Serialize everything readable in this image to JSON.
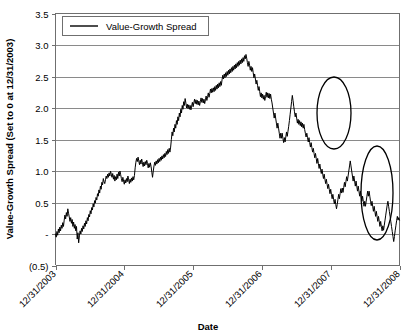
{
  "chart_data": {
    "type": "line",
    "title": "",
    "xlabel": "Date",
    "ylabel": "Value-Growth Spread (Set to 0 at 12/31/2003)",
    "legend": [
      "Value-Growth Spread"
    ],
    "legend_position": "top-left-inside",
    "grid": true,
    "ylim": [
      -0.5,
      3.5
    ],
    "yticks": [
      3.5,
      3.0,
      2.5,
      2.0,
      1.5,
      1.0,
      0.5,
      0,
      -0.5
    ],
    "ytick_labels": [
      "3.5",
      "3.0",
      "2.5",
      "2.0",
      "1.5",
      "1.0",
      "0.5",
      "-",
      "(0.5)"
    ],
    "xticks": [
      "12/31/2003",
      "12/31/2004",
      "12/31/2005",
      "12/31/2006",
      "12/31/2007",
      "12/31/2008"
    ],
    "xlim": [
      "12/31/2003",
      "12/31/2008"
    ],
    "series": [
      {
        "name": "Value-Growth Spread",
        "color": "#000000",
        "values": [
          0.0,
          -0.05,
          0.04,
          -0.02,
          0.08,
          0.02,
          0.11,
          0.05,
          0.14,
          0.09,
          0.18,
          0.12,
          0.22,
          0.3,
          0.24,
          0.34,
          0.28,
          0.4,
          0.33,
          0.27,
          0.2,
          0.26,
          0.17,
          0.23,
          0.12,
          0.19,
          0.09,
          0.15,
          0.05,
          0.12,
          -0.08,
          0.02,
          -0.14,
          -0.03,
          0.05,
          0.0,
          0.09,
          0.04,
          0.13,
          0.08,
          0.17,
          0.12,
          0.21,
          0.16,
          0.26,
          0.21,
          0.31,
          0.27,
          0.37,
          0.32,
          0.42,
          0.38,
          0.48,
          0.43,
          0.53,
          0.49,
          0.58,
          0.54,
          0.64,
          0.6,
          0.7,
          0.65,
          0.76,
          0.71,
          0.82,
          0.78,
          0.88,
          0.83,
          0.8,
          0.86,
          0.92,
          0.88,
          0.95,
          0.9,
          0.97,
          0.92,
          1.0,
          0.95,
          0.9,
          0.96,
          0.87,
          0.93,
          0.84,
          0.91,
          0.86,
          0.95,
          0.88,
          0.98,
          0.92,
          1.0,
          0.94,
          0.88,
          0.83,
          0.9,
          0.84,
          0.79,
          0.86,
          0.81,
          0.88,
          0.83,
          0.92,
          0.86,
          0.8,
          0.87,
          0.82,
          0.89,
          0.84,
          0.91,
          0.86,
          0.93,
          1.05,
          1.14,
          1.2,
          1.15,
          1.22,
          1.16,
          1.1,
          1.17,
          1.11,
          1.19,
          1.13,
          1.07,
          1.14,
          1.08,
          1.15,
          1.1,
          1.17,
          1.12,
          1.05,
          1.12,
          1.06,
          1.13,
          1.07,
          0.98,
          0.9,
          1.0,
          1.08,
          1.14,
          1.09,
          1.16,
          1.11,
          1.18,
          1.13,
          1.2,
          1.15,
          1.22,
          1.17,
          1.24,
          1.19,
          1.26,
          1.21,
          1.28,
          1.23,
          1.31,
          1.26,
          1.34,
          1.28,
          1.36,
          1.3,
          1.38,
          1.5,
          1.62,
          1.56,
          1.68,
          1.62,
          1.74,
          1.68,
          1.8,
          1.74,
          1.86,
          1.8,
          1.92,
          1.86,
          1.98,
          1.92,
          2.04,
          1.98,
          2.1,
          2.04,
          2.15,
          2.08,
          2.0,
          2.06,
          1.99,
          2.05,
          1.98,
          2.04,
          1.97,
          2.03,
          2.09,
          2.02,
          2.08,
          2.14,
          2.07,
          2.13,
          2.06,
          2.12,
          2.05,
          2.11,
          2.04,
          2.1,
          2.16,
          2.09,
          2.15,
          2.08,
          2.14,
          2.07,
          2.13,
          2.19,
          2.12,
          2.18,
          2.24,
          2.17,
          2.23,
          2.3,
          2.24,
          2.31,
          2.25,
          2.32,
          2.26,
          2.34,
          2.28,
          2.36,
          2.3,
          2.38,
          2.32,
          2.4,
          2.34,
          2.42,
          2.36,
          2.45,
          2.52,
          2.46,
          2.54,
          2.48,
          2.56,
          2.5,
          2.58,
          2.52,
          2.6,
          2.54,
          2.62,
          2.56,
          2.64,
          2.58,
          2.66,
          2.6,
          2.68,
          2.62,
          2.7,
          2.64,
          2.72,
          2.66,
          2.74,
          2.68,
          2.76,
          2.7,
          2.78,
          2.72,
          2.8,
          2.74,
          2.83,
          2.78,
          2.85,
          2.79,
          2.72,
          2.66,
          2.74,
          2.68,
          2.6,
          2.66,
          2.58,
          2.64,
          2.56,
          2.48,
          2.54,
          2.46,
          2.38,
          2.44,
          2.36,
          2.28,
          2.34,
          2.26,
          2.18,
          2.24,
          2.16,
          2.22,
          2.14,
          2.2,
          2.12,
          2.18,
          2.25,
          2.17,
          2.24,
          2.16,
          2.23,
          2.15,
          2.22,
          2.14,
          2.08,
          2.0,
          1.92,
          1.84,
          1.92,
          1.84,
          1.76,
          1.68,
          1.76,
          1.68,
          1.6,
          1.52,
          1.6,
          1.52,
          1.6,
          1.52,
          1.45,
          1.53,
          1.46,
          1.54,
          1.62,
          1.55,
          1.63,
          1.71,
          1.8,
          1.9,
          2.0,
          2.1,
          2.2,
          2.12,
          2.02,
          1.94,
          1.86,
          1.92,
          1.84,
          1.76,
          1.82,
          1.74,
          1.8,
          1.72,
          1.78,
          1.7,
          1.76,
          1.68,
          1.74,
          1.66,
          1.6,
          1.54,
          1.6,
          1.53,
          1.46,
          1.53,
          1.45,
          1.38,
          1.45,
          1.37,
          1.3,
          1.36,
          1.28,
          1.21,
          1.28,
          1.2,
          1.12,
          1.2,
          1.12,
          1.04,
          1.11,
          1.03,
          0.96,
          1.03,
          0.95,
          0.88,
          0.95,
          0.87,
          0.8,
          0.87,
          0.79,
          0.72,
          0.79,
          0.71,
          0.64,
          0.71,
          0.63,
          0.56,
          0.63,
          0.55,
          0.48,
          0.55,
          0.47,
          0.4,
          0.47,
          0.55,
          0.63,
          0.56,
          0.64,
          0.72,
          0.65,
          0.73,
          0.66,
          0.74,
          0.82,
          0.75,
          0.83,
          0.91,
          0.84,
          0.92,
          1.0,
          1.08,
          1.16,
          1.08,
          1.0,
          0.92,
          0.84,
          0.92,
          0.84,
          0.76,
          0.84,
          0.76,
          0.68,
          0.76,
          0.68,
          0.6,
          0.68,
          0.6,
          0.52,
          0.6,
          0.52,
          0.44,
          0.52,
          0.44,
          0.52,
          0.6,
          0.68,
          0.6,
          0.68,
          0.6,
          0.52,
          0.45,
          0.52,
          0.44,
          0.36,
          0.44,
          0.36,
          0.28,
          0.36,
          0.28,
          0.2,
          0.28,
          0.2,
          0.12,
          0.2,
          0.12,
          0.05,
          0.13,
          0.06,
          0.14,
          0.22,
          0.3,
          0.38,
          0.46,
          0.52,
          0.44,
          0.36,
          0.28,
          0.2,
          0.12,
          0.04,
          -0.04,
          -0.12,
          -0.04,
          0.05,
          0.13,
          0.21,
          0.28,
          0.22,
          0.26,
          0.22
        ]
      }
    ],
    "annotations": [
      {
        "type": "ellipse",
        "name": "highlight-ellipse-1",
        "cx": 334,
        "cy": 113,
        "rx": 17,
        "ry": 36,
        "rotation": 0
      },
      {
        "type": "ellipse",
        "name": "highlight-ellipse-2",
        "cx": 377,
        "cy": 193,
        "rx": 16,
        "ry": 47,
        "rotation": 0
      }
    ]
  }
}
